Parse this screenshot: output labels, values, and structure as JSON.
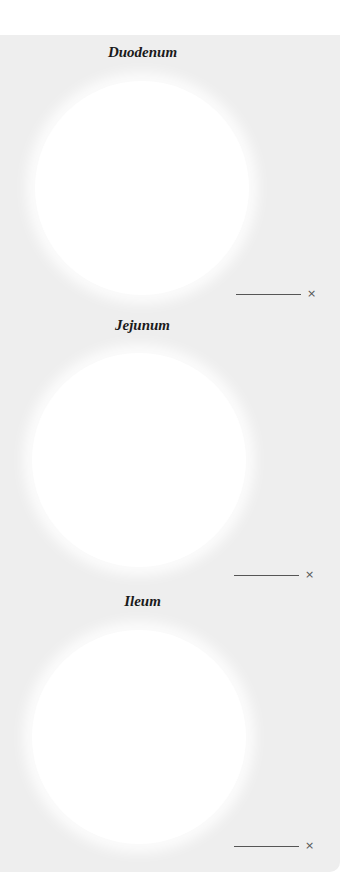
{
  "page": {
    "background_color": "#eeeeee",
    "sections": [
      {
        "title": "Duodenum",
        "magnification_value": "",
        "magnification_suffix": "×"
      },
      {
        "title": "Jejunum",
        "magnification_value": "",
        "magnification_suffix": "×"
      },
      {
        "title": "Ileum",
        "magnification_value": "",
        "magnification_suffix": "×"
      }
    ]
  }
}
